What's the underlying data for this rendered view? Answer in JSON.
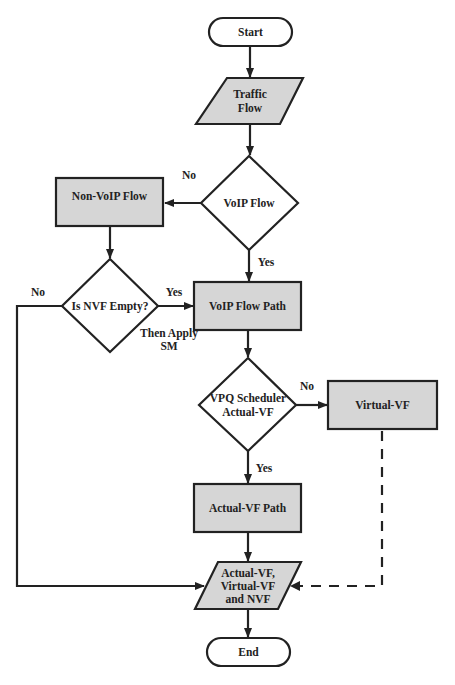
{
  "diagram": {
    "type": "flowchart",
    "colors": {
      "process_fill": "#d6d6d6",
      "stroke": "#222222",
      "background": "#ffffff"
    },
    "nodes": {
      "start": {
        "shape": "terminator",
        "label": "Start"
      },
      "traffic_flow": {
        "shape": "parallelogram",
        "lines": [
          "Traffic",
          "Flow"
        ]
      },
      "voip_flow": {
        "shape": "decision",
        "label": "VoIP Flow"
      },
      "non_voip_flow": {
        "shape": "process",
        "label": "Non-VoIP Flow"
      },
      "is_nvf_empty": {
        "shape": "decision",
        "label": "Is NVF Empty?"
      },
      "voip_flow_path": {
        "shape": "process",
        "label": "VoIP Flow Path"
      },
      "vpq_scheduler": {
        "shape": "decision",
        "lines": [
          "VPQ Scheduler",
          "Actual-VF"
        ]
      },
      "virtual_vf": {
        "shape": "process",
        "label": "Virtual-VF"
      },
      "actual_vf_path": {
        "shape": "process",
        "label": "Actual-VF Path"
      },
      "output": {
        "shape": "parallelogram",
        "lines": [
          "Actual-VF,",
          "Virtual-VF",
          "and NVF"
        ]
      },
      "end": {
        "shape": "terminator",
        "label": "End"
      }
    },
    "edge_labels": {
      "voip_no": "No",
      "voip_yes": "Yes",
      "nvf_no": "No",
      "nvf_yes": "Yes",
      "nvf_yes_note": [
        "Then Apply",
        "SM"
      ],
      "vpq_no": "No",
      "vpq_yes": "Yes"
    },
    "edges": [
      {
        "from": "start",
        "to": "traffic_flow"
      },
      {
        "from": "traffic_flow",
        "to": "voip_flow"
      },
      {
        "from": "voip_flow",
        "to": "non_voip_flow",
        "label": "No"
      },
      {
        "from": "voip_flow",
        "to": "voip_flow_path",
        "label": "Yes"
      },
      {
        "from": "non_voip_flow",
        "to": "is_nvf_empty"
      },
      {
        "from": "is_nvf_empty",
        "to": "voip_flow_path",
        "label": "Yes",
        "note": "Then Apply SM"
      },
      {
        "from": "is_nvf_empty",
        "to": "output",
        "label": "No"
      },
      {
        "from": "voip_flow_path",
        "to": "vpq_scheduler"
      },
      {
        "from": "vpq_scheduler",
        "to": "virtual_vf",
        "label": "No"
      },
      {
        "from": "vpq_scheduler",
        "to": "actual_vf_path",
        "label": "Yes"
      },
      {
        "from": "virtual_vf",
        "to": "output",
        "style": "dashed"
      },
      {
        "from": "actual_vf_path",
        "to": "output"
      },
      {
        "from": "output",
        "to": "end"
      }
    ]
  }
}
